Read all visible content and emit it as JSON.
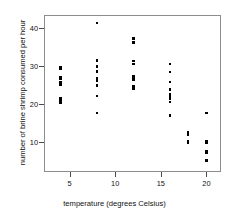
{
  "chart_data": {
    "type": "scatter",
    "title": "",
    "xlabel": "temperature (degrees Celsius)",
    "ylabel": "number of brine shrimp consumed per hour",
    "xlim": [
      2.2,
      21.6
    ],
    "ylim": [
      2.0,
      43.5
    ],
    "xticks": [
      5,
      10,
      15,
      20
    ],
    "xticklabels": [
      "5",
      "10",
      "15",
      "20"
    ],
    "yticks": [
      10,
      20,
      30,
      40
    ],
    "yticklabels": [
      "10",
      "20",
      "30",
      "40"
    ],
    "grid": false,
    "legend": null,
    "marker": "square",
    "marker_color": "#000000",
    "points": [
      {
        "x": 4,
        "y": 29.8
      },
      {
        "x": 4,
        "y": 29.3
      },
      {
        "x": 4,
        "y": 27.1
      },
      {
        "x": 4,
        "y": 26.6
      },
      {
        "x": 4,
        "y": 25.6
      },
      {
        "x": 4,
        "y": 25.0
      },
      {
        "x": 4,
        "y": 21.5
      },
      {
        "x": 4,
        "y": 20.7
      },
      {
        "x": 4,
        "y": 20.2
      },
      {
        "x": 8,
        "y": 41.4
      },
      {
        "x": 8,
        "y": 31.5
      },
      {
        "x": 8,
        "y": 29.9
      },
      {
        "x": 8,
        "y": 28.5
      },
      {
        "x": 8,
        "y": 26.8
      },
      {
        "x": 8,
        "y": 26.2
      },
      {
        "x": 8,
        "y": 24.9
      },
      {
        "x": 8,
        "y": 22.1
      },
      {
        "x": 8,
        "y": 17.6
      },
      {
        "x": 12,
        "y": 37.3
      },
      {
        "x": 12,
        "y": 36.2
      },
      {
        "x": 12,
        "y": 31.3
      },
      {
        "x": 12,
        "y": 30.6
      },
      {
        "x": 12,
        "y": 27.4
      },
      {
        "x": 12,
        "y": 26.8
      },
      {
        "x": 12,
        "y": 26.3
      },
      {
        "x": 12,
        "y": 24.6
      },
      {
        "x": 12,
        "y": 24.0
      },
      {
        "x": 16,
        "y": 30.6
      },
      {
        "x": 16,
        "y": 28.4
      },
      {
        "x": 16,
        "y": 25.8
      },
      {
        "x": 16,
        "y": 23.8
      },
      {
        "x": 16,
        "y": 22.6
      },
      {
        "x": 16,
        "y": 22.0
      },
      {
        "x": 16,
        "y": 21.4
      },
      {
        "x": 16,
        "y": 20.5
      },
      {
        "x": 16,
        "y": 16.9
      },
      {
        "x": 18,
        "y": 12.4
      },
      {
        "x": 18,
        "y": 11.9
      },
      {
        "x": 18,
        "y": 10.1
      },
      {
        "x": 18,
        "y": 9.7
      },
      {
        "x": 20,
        "y": 17.6
      },
      {
        "x": 20,
        "y": 10.2
      },
      {
        "x": 20,
        "y": 9.8
      },
      {
        "x": 20,
        "y": 7.6
      },
      {
        "x": 20,
        "y": 7.1
      },
      {
        "x": 20,
        "y": 5.0
      }
    ]
  }
}
